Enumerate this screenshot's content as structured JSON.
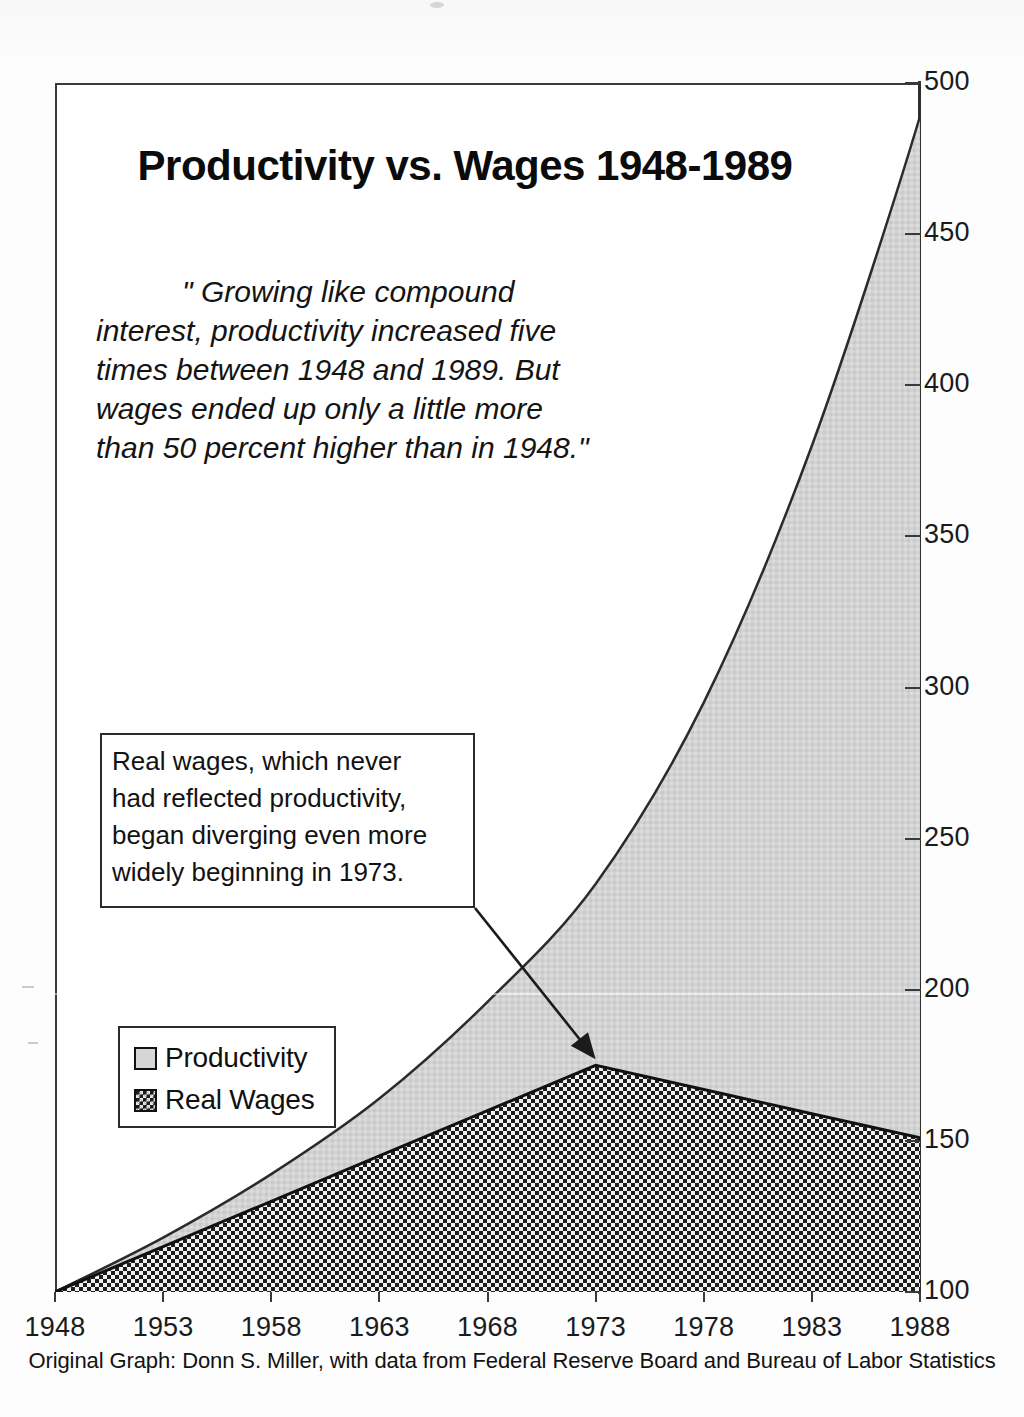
{
  "chart_data": {
    "type": "area",
    "title": "Productivity vs. Wages 1948-1989",
    "xlabel": "",
    "ylabel": "",
    "ylim": [
      100,
      500
    ],
    "xlim": [
      1948,
      1989
    ],
    "grid": false,
    "legend_position": "inside-lower-left",
    "categories": [
      1948,
      1953,
      1958,
      1963,
      1968,
      1973,
      1978,
      1983,
      1988
    ],
    "tick_labels_x": [
      "1948",
      "1953",
      "1958",
      "1963",
      "1968",
      "1973",
      "1978",
      "1983",
      "1988"
    ],
    "tick_labels_y": [
      "500",
      "450",
      "400",
      "350",
      "300",
      "250",
      "200",
      "150",
      "100"
    ],
    "tick_values_y": [
      500,
      450,
      400,
      350,
      300,
      250,
      200,
      150,
      100
    ],
    "series": [
      {
        "name": "Productivity",
        "fill": "light-gray",
        "values": [
          100,
          118,
          139,
          164,
          196,
          235,
          295,
          380,
          489
        ],
        "end_value_1989": 500
      },
      {
        "name": "Real Wages",
        "fill": "dark-checkered",
        "values": [
          100,
          115,
          130,
          145,
          160,
          175,
          167,
          159,
          151
        ],
        "peak_year": 1973,
        "peak_value": 175,
        "end_value_1989": 150
      }
    ],
    "annotations": [
      {
        "name": "quote",
        "lines": [
          "\" Growing like compound",
          "interest, productivity increased five",
          "times between 1948 and 1989. But",
          "wages ended up only a little more",
          "than 50 percent higher than in 1948.\""
        ]
      },
      {
        "name": "callout",
        "lines": [
          "Real wages, which never",
          "had reflected productivity,",
          "began diverging even more",
          "widely beginning in 1973."
        ],
        "arrow_target_year": 1973,
        "arrow_target_value": 175
      }
    ],
    "source_note": "Original Graph: Donn S. Miller, with data from Federal Reserve Board and Bureau of Labor Statistics"
  },
  "legend": {
    "items": [
      {
        "label": "Productivity",
        "swatch": "light-gray-square"
      },
      {
        "label": "Real Wages",
        "swatch": "dark-checkered-square"
      }
    ]
  },
  "colors": {
    "productivity_fill": "#d2d2d2",
    "wages_fill": "#1d1d1d",
    "line": "#2b2b2b",
    "text": "#111111",
    "background": "#ffffff"
  }
}
